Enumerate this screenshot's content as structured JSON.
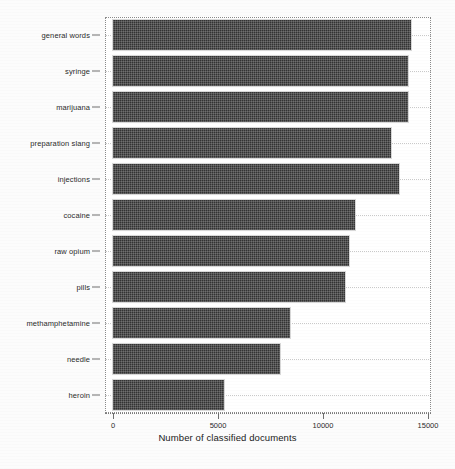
{
  "chart_data": {
    "type": "bar",
    "orientation": "horizontal",
    "title": "",
    "xlabel": "Number of classified documents",
    "ylabel": "",
    "xlim": [
      0,
      15000
    ],
    "xticks": [
      0,
      5000,
      10000,
      15000
    ],
    "xtick_labels": [
      "0",
      "5000",
      "10000",
      "15000"
    ],
    "grid": true,
    "legend": null,
    "bar_color": "#333333",
    "categories": [
      "general words",
      "syringe",
      "marijuana",
      "preparation slang",
      "injections",
      "cocaine",
      "raw opium",
      "pills",
      "methamphetamine",
      "needle",
      "heroin"
    ],
    "values": [
      14200,
      14050,
      14050,
      13250,
      13600,
      11500,
      11250,
      11050,
      8450,
      7950,
      5300
    ]
  }
}
